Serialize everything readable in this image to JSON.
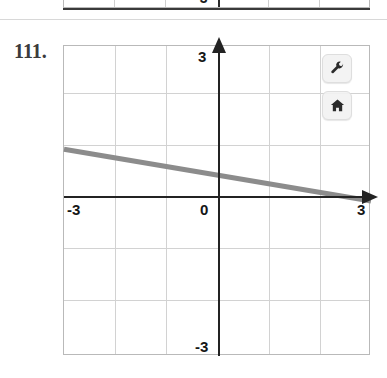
{
  "problem": {
    "number": "111."
  },
  "previous_problem": {
    "y_bottom_label": "-3"
  },
  "graph": {
    "x_axis": {
      "min_label": "-3",
      "max_label": "3",
      "origin_label": "0"
    },
    "y_axis": {
      "max_label": "3",
      "min_label": "-3"
    },
    "colors": {
      "line": "#8c8c8c",
      "axis": "#232323",
      "grid": "#d2d2d2",
      "border": "#b9b9b9"
    }
  },
  "toolbar": {
    "buttons": [
      {
        "name": "wrench-icon",
        "label": "Tools"
      },
      {
        "name": "home-icon",
        "label": "Home"
      }
    ]
  },
  "chart_data": {
    "type": "line",
    "title": "",
    "xlabel": "",
    "ylabel": "",
    "xlim": [
      -3,
      3
    ],
    "ylim": [
      -3,
      3
    ],
    "xticks": [
      -3,
      -2,
      -1,
      0,
      1,
      2,
      3
    ],
    "yticks": [
      -3,
      -2,
      -1,
      0,
      1,
      2,
      3
    ],
    "grid": true,
    "legend": null,
    "series": [
      {
        "name": "line",
        "x": [
          -3,
          3
        ],
        "y": [
          1,
          0
        ],
        "slope": -0.1667,
        "intercept": 0.5,
        "color": "#8c8c8c",
        "width": 5
      }
    ]
  }
}
